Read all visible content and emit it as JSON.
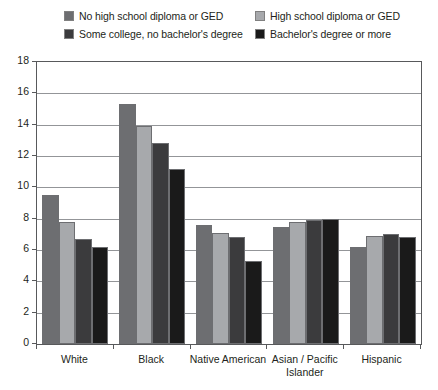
{
  "legend": {
    "items": [
      {
        "label": "No high school diploma or GED",
        "color": "#6d6e71",
        "swatch_name": "legend-swatch-no-hs"
      },
      {
        "label": "High school diploma or GED",
        "color": "#a7a9ac",
        "swatch_name": "legend-swatch-hs"
      },
      {
        "label": "Some college, no bachelor's degree",
        "color": "#3b3b3d",
        "swatch_name": "legend-swatch-some-college"
      },
      {
        "label": "Bachelor's degree or more",
        "color": "#1a1a1a",
        "swatch_name": "legend-swatch-bachelors"
      }
    ]
  },
  "axis": {
    "y_ticks": [
      "0",
      "2",
      "4",
      "6",
      "8",
      "10",
      "12",
      "14",
      "16",
      "18"
    ],
    "x_labels": [
      "White",
      "Black",
      "Native American",
      "Asian / Pacific Islander",
      "Hispanic"
    ]
  },
  "chart_data": {
    "type": "bar",
    "title": "",
    "subtitle": "",
    "xlabel": "",
    "ylabel": "",
    "ylim": [
      0,
      18
    ],
    "ytick_step": 2,
    "grid": true,
    "legend_position": "top",
    "categories": [
      "White",
      "Black",
      "Native American",
      "Asian / Pacific Islander",
      "Hispanic"
    ],
    "series": [
      {
        "name": "No high school diploma or GED",
        "color": "#6d6e71",
        "values": [
          9.5,
          15.3,
          7.6,
          7.5,
          6.2
        ]
      },
      {
        "name": "High school diploma or GED",
        "color": "#a7a9ac",
        "values": [
          7.8,
          13.9,
          7.1,
          7.8,
          6.9
        ]
      },
      {
        "name": "Some college, no bachelor's degree",
        "color": "#3b3b3d",
        "values": [
          6.7,
          12.8,
          6.8,
          7.9,
          7.0
        ]
      },
      {
        "name": "Bachelor's degree or more",
        "color": "#1a1a1a",
        "values": [
          6.2,
          11.2,
          5.3,
          8.0,
          6.8
        ]
      }
    ]
  }
}
